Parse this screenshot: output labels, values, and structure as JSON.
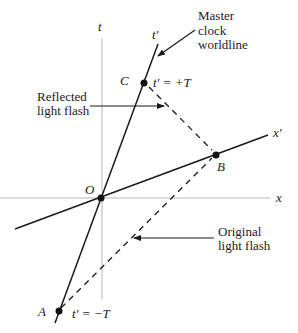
{
  "diagram": {
    "axes": {
      "t_label": "t",
      "x_label": "x",
      "t_prime_label": "t′",
      "x_prime_label": "x′"
    },
    "points": {
      "O": {
        "label": "O"
      },
      "A": {
        "label": "A",
        "annotation": "t′ = −T"
      },
      "B": {
        "label": "B"
      },
      "C": {
        "label": "C",
        "annotation": "t′ = +T"
      }
    },
    "callouts": {
      "master_line1": "Master",
      "master_line2": "clock",
      "master_line3": "worldline",
      "reflected_line1": "Reflected",
      "reflected_line2": "light flash",
      "original_line1": "Original",
      "original_line2": "light flash"
    },
    "colors": {
      "axis": "#b8b8b8",
      "line": "#1a1a1a",
      "text": "#222222"
    }
  }
}
